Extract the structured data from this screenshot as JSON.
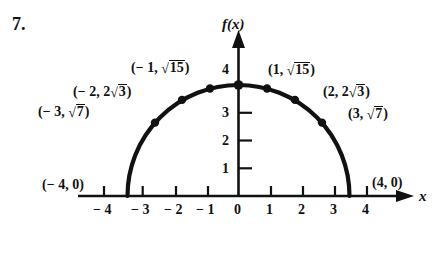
{
  "problem": {
    "number": "7."
  },
  "axes": {
    "y_label": "f(x)",
    "x_label": "x",
    "x_ticks": [
      "− 4",
      "− 3",
      "− 2",
      "− 1",
      "0",
      "1",
      "2",
      "3",
      "4"
    ],
    "x_tick_values": [
      -4,
      -3,
      -2,
      -1,
      0,
      1,
      2,
      3,
      4
    ],
    "y_ticks": [
      "1",
      "2",
      "3",
      "4"
    ],
    "y_tick_values": [
      1,
      2,
      3,
      4
    ]
  },
  "point_labels": {
    "left_4": "(− 4, 0)",
    "left_3": "(− 3, √7)",
    "left_2": "(− 2, 2√3)",
    "left_1": "(− 1, √15)",
    "right_1": "(1, √15)",
    "right_2": "(2, 2√3)",
    "right_3": "(3, √7)",
    "right_4": "(4, 0)"
  },
  "chart_data": {
    "type": "line",
    "title": "",
    "xlabel": "x",
    "ylabel": "f(x)",
    "function": "f(x) = sqrt(16 - x^2)",
    "xlim": [
      -4.6,
      4.9
    ],
    "ylim": [
      0,
      4.6
    ],
    "grid": false,
    "legend": "none",
    "x": [
      -4,
      -3,
      -2,
      -1,
      0,
      1,
      2,
      3,
      4
    ],
    "y": [
      0,
      2.6458,
      3.4641,
      3.873,
      4,
      3.873,
      3.4641,
      2.6458,
      0
    ],
    "marked_points": [
      {
        "x": -4,
        "y": 0,
        "label": "(− 4, 0)",
        "marker": false
      },
      {
        "x": -3,
        "y": 2.6458,
        "label": "(− 3, √7)",
        "marker": true
      },
      {
        "x": -2,
        "y": 3.4641,
        "label": "(− 2, 2√3)",
        "marker": true
      },
      {
        "x": -1,
        "y": 3.873,
        "label": "(− 1, √15)",
        "marker": true
      },
      {
        "x": 0,
        "y": 4,
        "label": "4",
        "marker": true
      },
      {
        "x": 1,
        "y": 3.873,
        "label": "(1, √15)",
        "marker": true
      },
      {
        "x": 2,
        "y": 3.4641,
        "label": "(2, 2√3)",
        "marker": true
      },
      {
        "x": 3,
        "y": 2.6458,
        "label": "(3, √7)",
        "marker": true
      },
      {
        "x": 4,
        "y": 0,
        "label": "(4, 0)",
        "marker": false
      }
    ]
  },
  "colors": {
    "ink": "#111111",
    "background": "#ffffff"
  }
}
